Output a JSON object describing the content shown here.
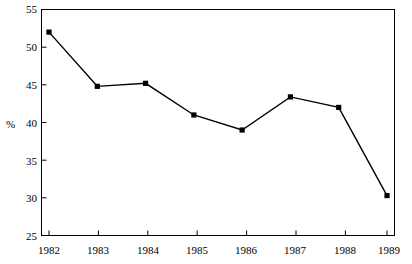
{
  "chart_data": {
    "type": "line",
    "title": "",
    "xlabel": "",
    "ylabel": "%",
    "categories": [
      "1982",
      "1983",
      "1984",
      "1985",
      "1986",
      "1987",
      "1988",
      "1989"
    ],
    "x": [
      1982,
      1983,
      1984,
      1985,
      1986,
      1987,
      1988,
      1989
    ],
    "values": [
      52.0,
      44.8,
      45.2,
      41.0,
      39.0,
      43.4,
      42.0,
      30.3
    ],
    "series": [
      {
        "name": "",
        "values": [
          52.0,
          44.8,
          45.2,
          41.0,
          39.0,
          43.4,
          42.0,
          30.3
        ]
      }
    ],
    "ylim": [
      25,
      55
    ],
    "yticks": [
      25,
      30,
      35,
      40,
      45,
      50,
      55
    ],
    "ytick_labels": [
      "25",
      "30",
      "35",
      "40",
      "45",
      "50",
      "55"
    ],
    "xtick_labels": [
      "1982",
      "1983",
      "1984",
      "1985",
      "1986",
      "1987",
      "1988",
      "1989"
    ],
    "grid": false,
    "legend": false,
    "legend_position": "none",
    "marker": "square",
    "line_color": "#000000",
    "marker_color": "#000000",
    "background_color": "#ffffff",
    "frame": true
  },
  "axis": {
    "y_unit_label": "%"
  }
}
